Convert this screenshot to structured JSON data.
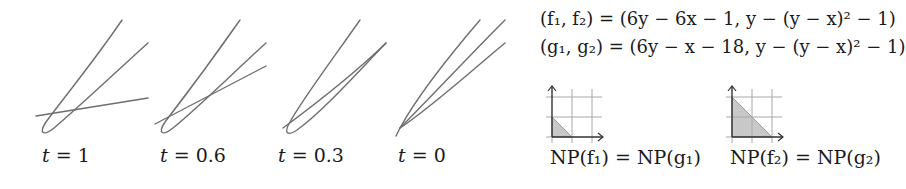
{
  "figure": {
    "panels": [
      {
        "id": "t1",
        "label_var": "t",
        "label_eq": " = ",
        "label_value": "1",
        "t": 1,
        "label_x": 42,
        "curves": [
          "M122,20 C95,60 62,100 46,122 C38,134 44,136 54,128 C80,106 118,70 148,43",
          "M36,116 L148,98"
        ]
      },
      {
        "id": "t06",
        "label_var": "t",
        "label_eq": " = ",
        "label_value": "0.6",
        "t": 0.6,
        "label_x": 160,
        "curves": [
          "M240,20 C212,60 182,100 165,122 C157,134 163,136 173,128 C200,106 236,70 266,43",
          "M155,124 L266,66"
        ]
      },
      {
        "id": "t03",
        "label_var": "t",
        "label_eq": " = ",
        "label_value": "0.3",
        "t": 0.3,
        "label_x": 278,
        "curves": [
          "M360,20 C332,60 302,100 290,122 C283,134 288,136 297,130 C322,112 356,74 386,43",
          "M283,128 C310,108 350,78 386,43"
        ]
      },
      {
        "id": "t0",
        "label_var": "t",
        "label_eq": " = ",
        "label_value": "0",
        "t": 0,
        "label_x": 398,
        "curves": [
          "M480,20 C450,55 418,95 400,128 L396,136",
          "M505,20 C470,55 430,98 400,128",
          "M505,43 C470,72 430,108 400,128"
        ]
      }
    ],
    "equations": {
      "line1": {
        "lhs": "(f₁, f₂)",
        "eq": " = ",
        "rhs": "(6y − 6x − 1, y − (y − x)² − 1)"
      },
      "line2": {
        "lhs": "(g₁, g₂)",
        "eq": " = ",
        "rhs": "(6y − x − 18, y − (y − x)² − 1)"
      }
    },
    "newton_polygons": [
      {
        "id": "np1",
        "caption": "NP(f₁) = NP(g₁)",
        "origin_x": 552,
        "origin_y": 137,
        "cell": 20,
        "triangle": [
          [
            0,
            0
          ],
          [
            0,
            1
          ],
          [
            1,
            0
          ]
        ]
      },
      {
        "id": "np2",
        "caption": "NP(f₂) = NP(g₂)",
        "origin_x": 732,
        "origin_y": 137,
        "cell": 20,
        "triangle": [
          [
            0,
            0
          ],
          [
            0,
            2
          ],
          [
            2,
            0
          ]
        ]
      }
    ],
    "colors": {
      "curve": "#6e6e6e",
      "grid": "#a8a8a8",
      "axis": "#333333",
      "fill": "#c8c8c8",
      "text": "#1a1a1a"
    }
  }
}
